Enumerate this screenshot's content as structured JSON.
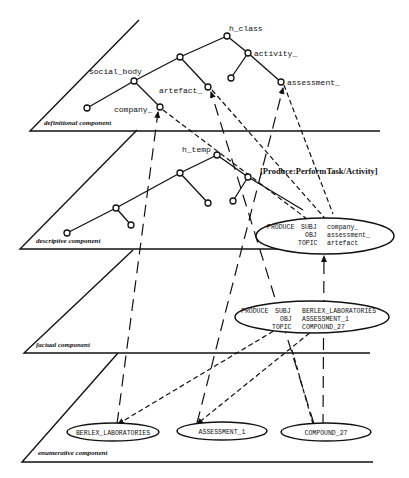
{
  "planes": {
    "definitional": "definitional component",
    "descriptive": "descriptive component",
    "factual": "factual component",
    "enumerative": "enumerative component"
  },
  "definitional_nodes": {
    "root": "h_class",
    "activity": "activity_",
    "social_body": "social_body",
    "artefact": "artefact_",
    "assessment": "assessment_",
    "company": "company_"
  },
  "descriptive": {
    "root": "h_temp",
    "frame_label": "[Produce:PerformTask/Activity]",
    "frame": {
      "row1": [
        "PRODUCE",
        "SUBJ",
        "company_"
      ],
      "row2": [
        "",
        "OBJ",
        "assessment_"
      ],
      "row3": [
        "",
        "TOPIC",
        "artefact"
      ]
    }
  },
  "factual": {
    "frame": {
      "row1": [
        "PRODUCE",
        "SUBJ",
        "BERLEX_LABORATORIES"
      ],
      "row2": [
        "",
        "OBJ",
        "ASSESSMENT_1"
      ],
      "row3": [
        "",
        "TOPIC",
        "COMPOUND_27"
      ]
    }
  },
  "enumerative": {
    "instances": [
      "BERLEX_LABORATORIES",
      "ASSESSMENT_1",
      "COMPOUND_27"
    ]
  }
}
